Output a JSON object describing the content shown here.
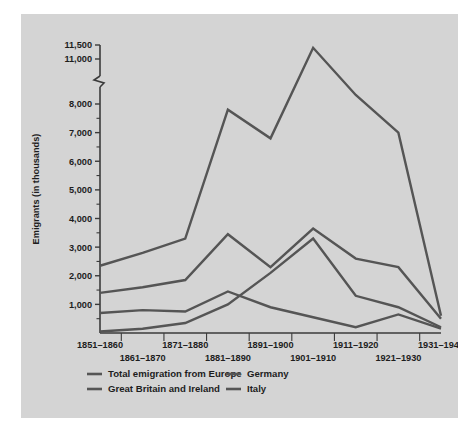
{
  "chart_data": {
    "type": "line",
    "title": "",
    "xlabel": "",
    "ylabel": "Emigrants (in thousands)",
    "categories": [
      "1851–1860",
      "1861–1870",
      "1871–1880",
      "1881–1890",
      "1891–1900",
      "1901–1910",
      "1911–1920",
      "1921–1930",
      "1931–1940"
    ],
    "ytick_labels": [
      "11,500",
      "11,000",
      "8,000",
      "7,000",
      "6,000",
      "5,000",
      "4,000",
      "3,000",
      "2,000",
      "1,000"
    ],
    "ytick_values": [
      11500,
      11000,
      8000,
      7000,
      6000,
      5000,
      4000,
      3000,
      2000,
      1000
    ],
    "axis_break": {
      "present": true,
      "between": [
        8000,
        11000
      ],
      "note": "zigzag break on y-axis"
    },
    "ylim": [
      0,
      11500
    ],
    "grid": false,
    "legend_position": "below-left",
    "series": [
      {
        "name": "Total emigration from Europe",
        "color": "#555555",
        "values": [
          2350,
          2800,
          3300,
          7800,
          6800,
          11400,
          8600,
          7000,
          600
        ]
      },
      {
        "name": "Great Britain and Ireland",
        "color": "#555555",
        "values": [
          1400,
          1600,
          1850,
          3450,
          2300,
          3650,
          2600,
          2300,
          500
        ]
      },
      {
        "name": "Germany",
        "color": "#555555",
        "values": [
          700,
          800,
          750,
          1450,
          900,
          550,
          200,
          650,
          150
        ]
      },
      {
        "name": "Italy",
        "color": "#555555",
        "values": [
          50,
          150,
          350,
          1000,
          2100,
          3300,
          1300,
          900,
          200
        ]
      }
    ]
  },
  "legend": {
    "entries": [
      "Total emigration from Europe",
      "Germany",
      "Great Britain and Ireland",
      "Italy"
    ]
  },
  "colors": {
    "panel_background": "#d4d4d4",
    "page_background": "#ffffff",
    "line": "#555555",
    "axis": "#3b3b3b",
    "text": "#1d1d1d"
  }
}
